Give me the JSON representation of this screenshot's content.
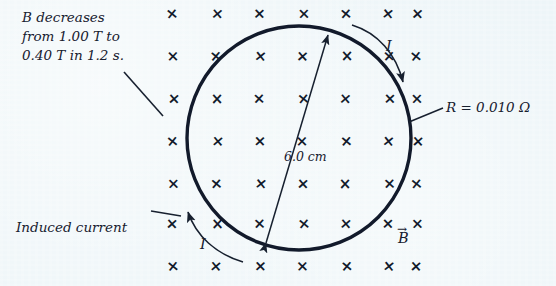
{
  "figure": {
    "background_color": "#edf5f8",
    "ink_color": "#17202f"
  },
  "annotations": {
    "field_note": "B decreases\nfrom 1.00 T to\n0.40 T in 1.2 s.",
    "field_note_lines": [
      "B decreases",
      "from 1.00 T to",
      "0.40 T in 1.2 s."
    ],
    "induced_current_label": "Induced current",
    "resistance_label": "R = 0.010 Ω",
    "diameter_label": "6.0 cm",
    "current_label_top": "I",
    "current_label_bottom": "I",
    "b_field_vector_label": "B",
    "b_field_vector_arrow": "→"
  },
  "values": {
    "B_initial": "1.00 T",
    "B_final": "0.40 T",
    "time_interval": "1.2 s",
    "resistance": "0.010 Ω",
    "loop_diameter": "6.0 cm"
  },
  "field_grid": {
    "symbol": "×",
    "meaning": "magnetic-field-into-page",
    "columns_x": [
      173,
      217,
      260,
      303,
      346,
      389,
      417
    ],
    "rows_y": [
      15,
      57,
      99,
      141,
      183,
      225,
      267
    ],
    "row_counts": [
      7,
      7,
      7,
      7,
      7,
      7,
      7
    ]
  },
  "loop": {
    "shape": "circle",
    "center_x": 299,
    "center_y": 138,
    "radius": 112
  },
  "diameter_arrow": {
    "x1": 266,
    "y1": 243,
    "x2": 328,
    "y2": 35,
    "double_headed": true
  },
  "current_arrows": [
    {
      "name": "current-arrow-top-right",
      "direction": "clockwise-into-lower-right"
    },
    {
      "name": "current-arrow-bottom-left",
      "direction": "counterclockwise-toward-upper-left"
    }
  ],
  "leader_lines": [
    {
      "name": "leader-field-note",
      "x1": 124,
      "y1": 72,
      "x2": 163,
      "y2": 116
    },
    {
      "name": "leader-induced-current",
      "x1": 151,
      "y1": 211,
      "x2": 181,
      "y2": 216
    },
    {
      "name": "leader-resistance",
      "x1": 443,
      "y1": 108,
      "x2": 409,
      "y2": 122
    }
  ]
}
